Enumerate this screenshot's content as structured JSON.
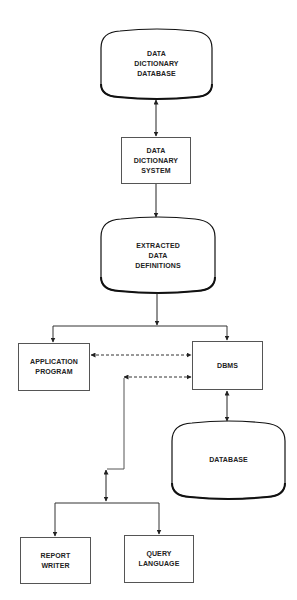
{
  "diagram": {
    "type": "data dictionary system flow diagram",
    "colors": {
      "stroke": "#444444",
      "cylinder_stroke": "#111111",
      "text": "#222222",
      "background": "#ffffff"
    },
    "nodes": {
      "dd_database": {
        "label": "DATA\nDICTIONARY\nDATABASE",
        "shape": "storage"
      },
      "dd_system": {
        "label": "DATA\nDICTIONARY\nSYSTEM",
        "shape": "box"
      },
      "extracted_defs": {
        "label": "EXTRACTED\nDATA\nDEFINITIONS",
        "shape": "storage"
      },
      "application_program": {
        "label": "APPLICATION\nPROGRAM",
        "shape": "box"
      },
      "dbms": {
        "label": "DBMS",
        "shape": "box"
      },
      "database": {
        "label": "DATABASE",
        "shape": "storage"
      },
      "report_writer": {
        "label": "REPORT\nWRITER",
        "shape": "box"
      },
      "query_language": {
        "label": "QUERY\nLANGUAGE",
        "shape": "box"
      }
    },
    "edges": [
      {
        "from": "dd_database",
        "to": "dd_system",
        "style": "solid",
        "direction": "both"
      },
      {
        "from": "dd_system",
        "to": "extracted_defs",
        "style": "solid",
        "direction": "forward"
      },
      {
        "from": "extracted_defs",
        "to": "application_program",
        "style": "solid",
        "direction": "forward"
      },
      {
        "from": "extracted_defs",
        "to": "dbms",
        "style": "solid",
        "direction": "forward"
      },
      {
        "from": "application_program",
        "to": "dbms",
        "style": "dashed",
        "direction": "both"
      },
      {
        "from": "report_writer/query_language",
        "to": "dbms",
        "style": "dashed",
        "direction": "both"
      },
      {
        "from": "dbms",
        "to": "database",
        "style": "solid",
        "direction": "both"
      },
      {
        "from": "junction",
        "to": "report_writer",
        "style": "solid",
        "direction": "forward"
      },
      {
        "from": "junction",
        "to": "query_language",
        "style": "solid",
        "direction": "forward"
      }
    ]
  }
}
